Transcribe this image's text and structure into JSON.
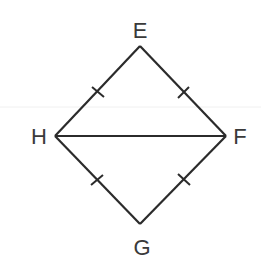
{
  "diagram": {
    "type": "geometry-figure",
    "shape": "quadrilateral (kite/rhombus) with diagonal",
    "stroke_color": "#2b2b2b",
    "label_color": "#3a3a3a",
    "background_color": "#ffffff",
    "vertices": [
      {
        "label": "E",
        "x": 140,
        "y": 46,
        "label_x": 140,
        "label_y": 38
      },
      {
        "label": "F",
        "x": 226,
        "y": 136,
        "label_x": 240,
        "label_y": 144
      },
      {
        "label": "G",
        "x": 140,
        "y": 224,
        "label_x": 143,
        "label_y": 255
      },
      {
        "label": "H",
        "x": 55,
        "y": 136,
        "label_x": 40,
        "label_y": 144
      }
    ],
    "segments": [
      {
        "from": "E",
        "to": "F",
        "tick_marks": 1
      },
      {
        "from": "F",
        "to": "G",
        "tick_marks": 1
      },
      {
        "from": "G",
        "to": "H",
        "tick_marks": 1
      },
      {
        "from": "H",
        "to": "E",
        "tick_marks": 1
      },
      {
        "from": "H",
        "to": "F",
        "tick_marks": 0
      }
    ],
    "congruence_note": "All four sides EF, FG, GH, HE marked with single tick marks (congruent)"
  }
}
